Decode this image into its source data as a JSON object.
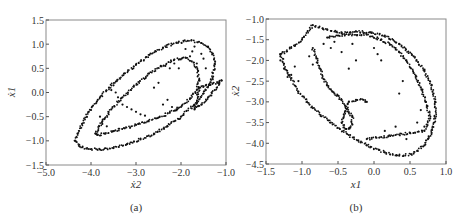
{
  "chart_data": [
    {
      "type": "scatter",
      "panel_label": "(a)",
      "xlabel": "ẋ2",
      "ylabel": "ẋ1",
      "xlim": [
        -5.0,
        -1.0
      ],
      "ylim": [
        -1.5,
        1.5
      ],
      "xticks": [
        -5.0,
        -4.0,
        -3.0,
        -2.0,
        -1.0
      ],
      "xtick_labels": [
        "−5.0",
        "−4.0",
        "−3.0",
        "−2.0",
        "−1.0"
      ],
      "yticks": [
        -1.5,
        -1.0,
        -0.5,
        0.0,
        0.5,
        1.0,
        1.5
      ],
      "ytick_labels": [
        "−1.5",
        "−1.0",
        "−0.5",
        "0.0",
        "0.5",
        "1.0",
        "1.5"
      ],
      "grid": false,
      "series": [
        {
          "name": "outer-loop",
          "x": [
            -4.35,
            -4.3,
            -4.2,
            -4.05,
            -3.85,
            -3.6,
            -3.3,
            -3.0,
            -2.7,
            -2.4,
            -2.1,
            -1.85,
            -1.6,
            -1.4,
            -1.3,
            -1.25,
            -1.3,
            -1.45,
            -1.7,
            -2.0,
            -2.3,
            -2.6,
            -2.9,
            -3.2,
            -3.5,
            -3.8,
            -4.05,
            -4.25,
            -4.35
          ],
          "y": [
            -1.0,
            -0.85,
            -0.65,
            -0.4,
            -0.15,
            0.1,
            0.35,
            0.58,
            0.78,
            0.93,
            1.03,
            1.07,
            1.05,
            0.95,
            0.8,
            0.6,
            0.3,
            0.05,
            -0.25,
            -0.5,
            -0.7,
            -0.85,
            -0.97,
            -1.07,
            -1.15,
            -1.18,
            -1.17,
            -1.12,
            -1.0
          ]
        },
        {
          "name": "inner-loop",
          "x": [
            -3.9,
            -3.75,
            -3.55,
            -3.3,
            -3.05,
            -2.75,
            -2.45,
            -2.15,
            -1.9,
            -1.72,
            -1.62,
            -1.6,
            -1.65,
            -1.8,
            -2.0,
            -2.25,
            -2.5,
            -2.75,
            -3.0,
            -3.25,
            -3.5,
            -3.7,
            -3.85,
            -3.9
          ],
          "y": [
            -0.85,
            -0.6,
            -0.35,
            -0.1,
            0.12,
            0.35,
            0.55,
            0.68,
            0.72,
            0.62,
            0.45,
            0.25,
            0.05,
            -0.12,
            -0.3,
            -0.42,
            -0.52,
            -0.6,
            -0.67,
            -0.74,
            -0.8,
            -0.85,
            -0.88,
            -0.85
          ]
        },
        {
          "name": "right-wedge",
          "x": [
            -1.6,
            -1.45,
            -1.3,
            -1.15,
            -1.1,
            -1.25,
            -1.4,
            -1.55,
            -1.7,
            -1.6
          ],
          "y": [
            0.1,
            0.15,
            0.18,
            0.22,
            0.25,
            0.05,
            -0.1,
            -0.25,
            -0.35,
            0.1
          ]
        },
        {
          "name": "scattered-filaments",
          "x": [
            -3.55,
            -3.5,
            -3.45,
            -3.4,
            -3.3,
            -3.2,
            -3.1,
            -3.0,
            -2.9,
            -2.8,
            -2.6,
            -2.5,
            -2.4,
            -2.3,
            -2.2,
            -2.1,
            -1.9,
            -1.8,
            -1.75,
            -1.7,
            -1.65,
            -1.55,
            -1.5,
            -1.45,
            -3.8,
            -3.75,
            -3.7,
            -3.65,
            -2.35,
            -2.25,
            -2.15,
            -2.05
          ],
          "y": [
            0.05,
            0.15,
            0.0,
            -0.1,
            -0.25,
            -0.3,
            -0.35,
            -0.4,
            -0.45,
            -0.48,
            0.1,
            0.2,
            -0.25,
            -0.15,
            -0.3,
            -0.35,
            0.9,
            0.75,
            0.85,
            0.95,
            0.6,
            0.8,
            0.7,
            0.5,
            -0.5,
            -0.65,
            -0.55,
            -0.7,
            0.55,
            0.5,
            0.6,
            0.5
          ]
        }
      ]
    },
    {
      "type": "scatter",
      "panel_label": "(b)",
      "xlabel": "x1",
      "ylabel": "ẋ2",
      "xlim": [
        -1.5,
        1.0
      ],
      "ylim": [
        -4.5,
        -1.0
      ],
      "xticks": [
        -1.5,
        -1.0,
        -0.5,
        0.0,
        0.5,
        1.0
      ],
      "xtick_labels": [
        "−1.5",
        "−1.0",
        "−0.5",
        "0.0",
        "0.5",
        "1.0"
      ],
      "yticks": [
        -4.5,
        -4.0,
        -3.5,
        -3.0,
        -2.5,
        -2.0,
        -1.5,
        -1.0
      ],
      "ytick_labels": [
        "−4.5",
        "−4.0",
        "−3.5",
        "−3.0",
        "−2.5",
        "−2.0",
        "−1.5",
        "−1.0"
      ],
      "grid": false,
      "series": [
        {
          "name": "outer-loop",
          "x": [
            -1.3,
            -1.2,
            -1.05,
            -0.85,
            -0.6,
            -0.35,
            -0.1,
            0.15,
            0.35,
            0.55,
            0.7,
            0.8,
            0.85,
            0.85,
            0.8,
            0.7,
            0.55,
            0.35,
            0.15,
            -0.05,
            -0.25,
            -0.45,
            -0.65,
            -0.85,
            -1.0,
            -1.15,
            -1.3
          ],
          "y": [
            -1.85,
            -2.3,
            -2.75,
            -3.15,
            -3.5,
            -3.8,
            -4.05,
            -4.22,
            -4.3,
            -4.25,
            -4.05,
            -3.75,
            -3.4,
            -3.0,
            -2.6,
            -2.25,
            -1.9,
            -1.6,
            -1.4,
            -1.32,
            -1.3,
            -1.35,
            -1.25,
            -1.15,
            -1.5,
            -1.7,
            -1.85
          ]
        },
        {
          "name": "inner-loop",
          "x": [
            -0.65,
            -0.5,
            -0.35,
            -0.1,
            0.1,
            0.3,
            0.45,
            0.55,
            0.65,
            0.72,
            0.78,
            0.7,
            0.5,
            0.3,
            0.1,
            -0.1
          ],
          "y": [
            -1.45,
            -1.4,
            -1.38,
            -1.38,
            -1.5,
            -1.7,
            -2.0,
            -2.3,
            -2.65,
            -3.0,
            -3.4,
            -3.7,
            -3.75,
            -3.8,
            -3.85,
            -3.9
          ]
        },
        {
          "name": "inner-filament",
          "x": [
            -0.85,
            -0.8,
            -0.75,
            -0.7,
            -0.65,
            -0.6,
            -0.55,
            -0.5,
            -0.45,
            -0.4,
            -0.35,
            -0.3,
            -0.3,
            -0.35,
            -0.4,
            -0.45,
            -0.42,
            -0.35,
            -0.25,
            -0.15,
            -0.1
          ],
          "y": [
            -1.7,
            -1.95,
            -2.2,
            -2.45,
            -2.6,
            -2.7,
            -2.8,
            -2.85,
            -2.95,
            -3.1,
            -3.25,
            -3.35,
            -3.55,
            -3.65,
            -3.65,
            -3.5,
            -3.3,
            -3.0,
            -2.95,
            -2.95,
            -3.0
          ]
        },
        {
          "name": "scattered-filaments",
          "x": [
            -1.3,
            -1.25,
            -1.2,
            -1.15,
            -1.1,
            -1.05,
            -0.9,
            -0.85,
            -0.7,
            -0.6,
            -0.55,
            -0.45,
            -0.35,
            -0.3,
            -0.25,
            0.0,
            0.05,
            0.1,
            0.15,
            0.3,
            0.35,
            0.4,
            0.45,
            0.6,
            0.65,
            0.7,
            0.75
          ],
          "y": [
            -2.0,
            -2.2,
            -2.4,
            -2.35,
            -2.15,
            -2.5,
            -1.9,
            -2.1,
            -1.6,
            -1.7,
            -1.55,
            -1.8,
            -2.2,
            -1.6,
            -2.0,
            -1.7,
            -1.85,
            -2.0,
            -3.7,
            -3.6,
            -2.8,
            -2.5,
            -3.9,
            -3.5,
            -3.2,
            -3.6,
            -3.9
          ]
        }
      ]
    }
  ]
}
